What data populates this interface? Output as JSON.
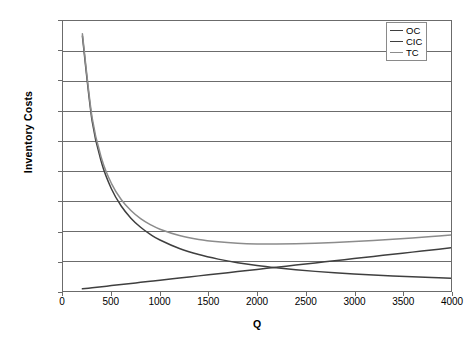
{
  "chart_data": {
    "type": "line",
    "title": "",
    "xlabel": "Q",
    "ylabel": "Inventory Costs",
    "xlim": [
      0,
      4000
    ],
    "ylim": [
      0,
      9000
    ],
    "xticks": [
      0,
      500,
      1000,
      1500,
      2000,
      2500,
      3000,
      3500,
      4000
    ],
    "yticks": [
      0,
      1000,
      2000,
      3000,
      4000,
      5000,
      6000,
      7000,
      8000,
      9000
    ],
    "grid": "horizontal",
    "legend_position": "top-right",
    "x": [
      200,
      300,
      400,
      500,
      600,
      700,
      800,
      900,
      1000,
      1200,
      1400,
      1600,
      1800,
      2000,
      2200,
      2400,
      2600,
      2800,
      3000,
      3200,
      3400,
      3600,
      3800,
      4000
    ],
    "series": [
      {
        "name": "OC",
        "color": "#3f3f3f",
        "values": [
          8500,
          5670,
          4250,
          3400,
          2833,
          2429,
          2125,
          1889,
          1700,
          1417,
          1214,
          1063,
          944,
          850,
          773,
          708,
          654,
          607,
          567,
          531,
          500,
          472,
          447,
          425
        ]
      },
      {
        "name": "CIC",
        "color": "#3f3f3f",
        "values": [
          72,
          108,
          144,
          180,
          216,
          252,
          288,
          324,
          360,
          432,
          504,
          576,
          648,
          720,
          792,
          864,
          936,
          1008,
          1080,
          1152,
          1224,
          1296,
          1368,
          1440
        ]
      },
      {
        "name": "TC",
        "color": "#8c8c8c",
        "values": [
          8572,
          5778,
          4394,
          3580,
          3049,
          2681,
          2413,
          2213,
          2060,
          1849,
          1718,
          1639,
          1592,
          1570,
          1565,
          1572,
          1590,
          1615,
          1647,
          1683,
          1724,
          1768,
          1815,
          1865
        ]
      }
    ]
  },
  "legend": {
    "items": [
      {
        "label": "OC"
      },
      {
        "label": "CIC"
      },
      {
        "label": "TC"
      }
    ]
  },
  "colors": {
    "axis": "#6b6b6b",
    "grid": "#6b6b6b",
    "text": "#000000",
    "background": "#ffffff"
  }
}
